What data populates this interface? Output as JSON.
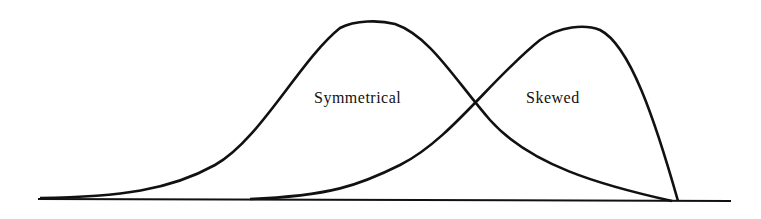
{
  "diagram": {
    "labels": {
      "symmetrical": "Symmetrical",
      "skewed": "Skewed"
    },
    "colors": {
      "stroke": "#111111",
      "background": "#ffffff"
    }
  }
}
